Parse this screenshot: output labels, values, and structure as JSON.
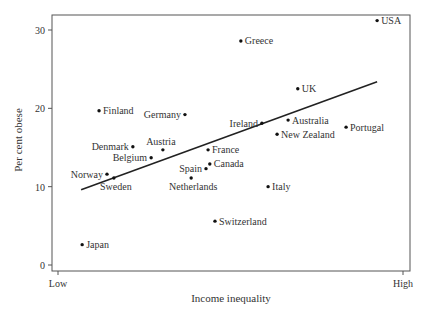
{
  "chart_data": {
    "type": "scatter",
    "title": "",
    "xlabel": "Income inequality",
    "ylabel": "Per cent obese",
    "xlim": [
      0,
      100
    ],
    "ylim": [
      0,
      30
    ],
    "x_tick_labels": [
      {
        "value": 0,
        "label": "Low"
      },
      {
        "value": 100,
        "label": "High"
      }
    ],
    "y_ticks": [
      0,
      10,
      20,
      30
    ],
    "grid": false,
    "legend": null,
    "points": [
      {
        "label": "USA",
        "x": 92.5,
        "y": 31.2,
        "label_pos": "right"
      },
      {
        "label": "Greece",
        "x": 53.0,
        "y": 28.6,
        "label_pos": "right"
      },
      {
        "label": "UK",
        "x": 69.5,
        "y": 22.5,
        "label_pos": "right"
      },
      {
        "label": "Finland",
        "x": 11.9,
        "y": 19.7,
        "label_pos": "right"
      },
      {
        "label": "Germany",
        "x": 36.8,
        "y": 19.2,
        "label_pos": "left"
      },
      {
        "label": "Ireland",
        "x": 59.1,
        "y": 18.1,
        "label_pos": "left"
      },
      {
        "label": "Australia",
        "x": 66.7,
        "y": 18.5,
        "label_pos": "right"
      },
      {
        "label": "Portugal",
        "x": 83.5,
        "y": 17.6,
        "label_pos": "right"
      },
      {
        "label": "New Zealand",
        "x": 63.5,
        "y": 16.7,
        "label_pos": "right"
      },
      {
        "label": "Denmark",
        "x": 21.7,
        "y": 15.1,
        "label_pos": "left"
      },
      {
        "label": "Austria",
        "x": 30.4,
        "y": 14.7,
        "label_pos": "above"
      },
      {
        "label": "France",
        "x": 43.5,
        "y": 14.7,
        "label_pos": "right"
      },
      {
        "label": "Belgium",
        "x": 27.0,
        "y": 13.7,
        "label_pos": "left"
      },
      {
        "label": "Canada",
        "x": 44.0,
        "y": 12.9,
        "label_pos": "right"
      },
      {
        "label": "Spain",
        "x": 42.9,
        "y": 12.3,
        "label_pos": "left"
      },
      {
        "label": "Netherlands",
        "x": 38.6,
        "y": 11.1,
        "label_pos": "below"
      },
      {
        "label": "Norway",
        "x": 14.2,
        "y": 11.6,
        "label_pos": "left"
      },
      {
        "label": "Sweden",
        "x": 16.2,
        "y": 11.1,
        "label_pos": "below"
      },
      {
        "label": "Italy",
        "x": 60.9,
        "y": 10.0,
        "label_pos": "right"
      },
      {
        "label": "Switzerland",
        "x": 45.5,
        "y": 5.6,
        "label_pos": "right"
      },
      {
        "label": "Japan",
        "x": 7.0,
        "y": 2.6,
        "label_pos": "right"
      }
    ],
    "regression_line": {
      "x": [
        6.7,
        92.5
      ],
      "y": [
        9.6,
        23.4
      ]
    }
  },
  "style": {
    "axis_color": "#555555",
    "point_color": "#111111",
    "line_color": "#222222",
    "text_color": "#333333"
  }
}
